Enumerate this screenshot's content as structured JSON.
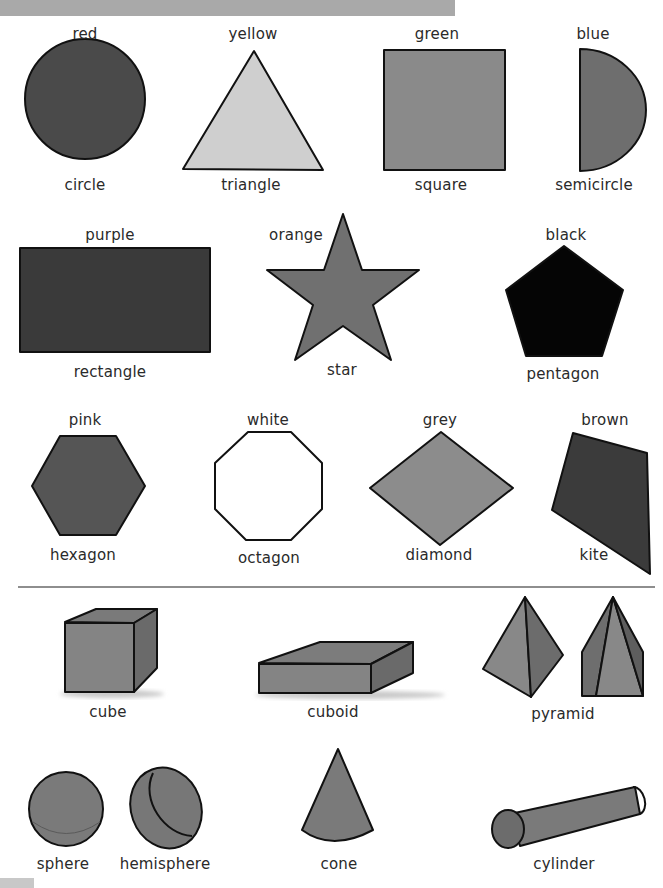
{
  "page": {
    "header_bar_color": "#a9a9a9",
    "divider_color": "#8e8e8e"
  },
  "flat_shapes": [
    {
      "color_label": "red",
      "shape_label": "circle",
      "fill": "#4a4a4a"
    },
    {
      "color_label": "yellow",
      "shape_label": "triangle",
      "fill": "#cfcfcf"
    },
    {
      "color_label": "green",
      "shape_label": "square",
      "fill": "#8a8a8a"
    },
    {
      "color_label": "blue",
      "shape_label": "semicircle",
      "fill": "#6e6e6e"
    },
    {
      "color_label": "purple",
      "shape_label": "rectangle",
      "fill": "#3a3a3a"
    },
    {
      "color_label": "orange",
      "shape_label": "star",
      "fill": "#707070"
    },
    {
      "color_label": "black",
      "shape_label": "pentagon",
      "fill": "#050505"
    },
    {
      "color_label": "pink",
      "shape_label": "hexagon",
      "fill": "#555555"
    },
    {
      "color_label": "white",
      "shape_label": "octagon",
      "fill": "#ffffff"
    },
    {
      "color_label": "grey",
      "shape_label": "diamond",
      "fill": "#8c8c8c"
    },
    {
      "color_label": "brown",
      "shape_label": "kite",
      "fill": "#3b3b3b"
    }
  ],
  "solid_shapes": [
    {
      "label": "cube"
    },
    {
      "label": "cuboid"
    },
    {
      "label": "pyramid"
    },
    {
      "label": "sphere"
    },
    {
      "label": "hemisphere"
    },
    {
      "label": "cone"
    },
    {
      "label": "cylinder"
    }
  ]
}
